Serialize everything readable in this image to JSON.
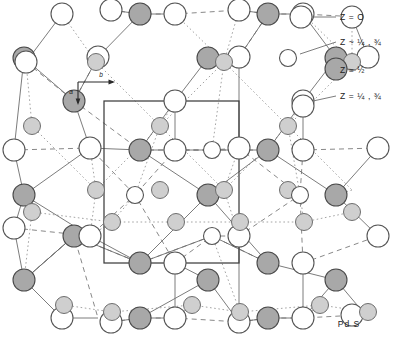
{
  "figure": {
    "caption": "Pd S",
    "axes": {
      "horizontal_label": "b",
      "vertical_label": "a"
    },
    "legend": [
      {
        "id": "z0",
        "marker": "open-circle-large",
        "text": "Z = O"
      },
      {
        "id": "zq-open",
        "marker": "open-circle-small",
        "text": "Z ~ ¼ , ¾"
      },
      {
        "id": "zhalf",
        "marker": "gray-circle-large",
        "text": "Z = ½"
      },
      {
        "id": "zq-gray",
        "marker": "gray-circle-small",
        "text": "Z = ¼ , ¾"
      }
    ]
  },
  "chart_data": {
    "type": "scatter",
    "title": "Pd S",
    "xlabel": "b",
    "ylabel": "a",
    "grid": false,
    "legend_position": "top-right",
    "xlim": [
      0,
      393
    ],
    "ylim": [
      0,
      360
    ],
    "series": [
      {
        "name": "Z = O",
        "style": "open-circle-large",
        "radius": 11,
        "points": [
          [
            62,
            14
          ],
          [
            111,
            10
          ],
          [
            175,
            14
          ],
          [
            239,
            10
          ],
          [
            303,
            14
          ],
          [
            352,
            17
          ],
          [
            26,
            62
          ],
          [
            98,
            57
          ],
          [
            175,
            101
          ],
          [
            239,
            57
          ],
          [
            303,
            101
          ],
          [
            368,
            57
          ],
          [
            14,
            150
          ],
          [
            90,
            148
          ],
          [
            175,
            150
          ],
          [
            239,
            148
          ],
          [
            303,
            150
          ],
          [
            378,
            148
          ],
          [
            14,
            228
          ],
          [
            90,
            236
          ],
          [
            175,
            263
          ],
          [
            239,
            236
          ],
          [
            303,
            263
          ],
          [
            378,
            236
          ],
          [
            62,
            318
          ],
          [
            111,
            322
          ],
          [
            175,
            318
          ],
          [
            239,
            322
          ],
          [
            303,
            318
          ],
          [
            352,
            315
          ]
        ]
      },
      {
        "name": "Z = ½",
        "style": "gray-circle-large",
        "radius": 11,
        "points": [
          [
            140,
            14
          ],
          [
            268,
            14
          ],
          [
            24,
            58
          ],
          [
            208,
            58
          ],
          [
            336,
            58
          ],
          [
            74,
            101
          ],
          [
            140,
            150
          ],
          [
            268,
            150
          ],
          [
            24,
            195
          ],
          [
            208,
            195
          ],
          [
            336,
            195
          ],
          [
            74,
            236
          ],
          [
            140,
            263
          ],
          [
            268,
            263
          ],
          [
            24,
            280
          ],
          [
            208,
            280
          ],
          [
            336,
            280
          ],
          [
            140,
            318
          ],
          [
            268,
            318
          ]
        ]
      },
      {
        "name": "Z ~ ¼ , ¾",
        "style": "open-circle-small",
        "radius": 8.5,
        "points": [
          [
            135,
            195
          ],
          [
            212,
            150
          ],
          [
            212,
            236
          ],
          [
            300,
            195
          ]
        ]
      },
      {
        "name": "Z = ¼ , ¾",
        "style": "gray-circle-small",
        "radius": 8.5,
        "points": [
          [
            96,
            62
          ],
          [
            160,
            126
          ],
          [
            224,
            62
          ],
          [
            288,
            126
          ],
          [
            352,
            62
          ],
          [
            32,
            126
          ],
          [
            96,
            190
          ],
          [
            160,
            190
          ],
          [
            224,
            190
          ],
          [
            288,
            190
          ],
          [
            32,
            212
          ],
          [
            112,
            222
          ],
          [
            176,
            222
          ],
          [
            240,
            222
          ],
          [
            304,
            222
          ],
          [
            64,
            305
          ],
          [
            192,
            305
          ],
          [
            320,
            305
          ],
          [
            352,
            212
          ],
          [
            112,
            312
          ],
          [
            240,
            312
          ],
          [
            368,
            312
          ]
        ]
      }
    ],
    "unit_cell": {
      "x": 104,
      "y": 101,
      "width": 135,
      "height": 162
    }
  }
}
